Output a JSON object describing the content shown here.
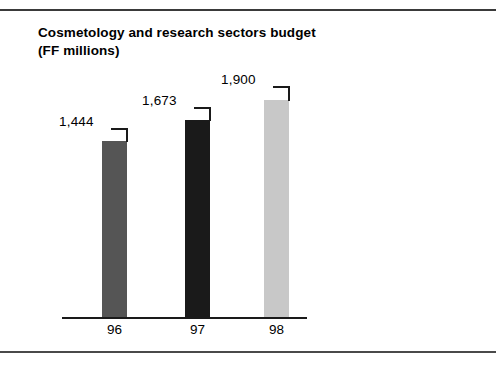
{
  "figure": {
    "width": 496,
    "height": 370,
    "background": "#ffffff",
    "rule_color": "#3a3a3a"
  },
  "title": {
    "line1": "Cosmetology and research sectors budget",
    "line2": "(FF millions)"
  },
  "chart_data": {
    "type": "bar",
    "title": "Cosmetology and research sectors budget (FF millions)",
    "xlabel": "",
    "ylabel": "FF millions",
    "categories": [
      "96",
      "97",
      "98"
    ],
    "values": [
      1444,
      1673,
      1900
    ],
    "value_labels": [
      "1,444",
      "1,673",
      "1,900"
    ],
    "series": [
      {
        "name": "Cosmetology and research sectors budget",
        "values": [
          1444,
          1673,
          1900
        ]
      }
    ],
    "bar_colors": [
      "#555555",
      "#1a1a1a",
      "#c8c8c8"
    ],
    "ylim": [
      0,
      2100
    ],
    "grid": false,
    "legend": false,
    "axis_color": "#1a1a1a",
    "units": "FF millions"
  },
  "bars": [
    {
      "category": "96",
      "value": 1444,
      "label": "1,444",
      "color": "#555555",
      "left": 102,
      "top": 141,
      "width": 25,
      "height": 176,
      "label_left": 59,
      "label_top": 114,
      "leader_h_left": 111,
      "leader_h_top": 128,
      "leader_h_width": 17,
      "leader_v_left": 126,
      "leader_v_top": 128,
      "leader_v_height": 14,
      "tick_left": 102,
      "tick_width": 25
    },
    {
      "category": "97",
      "value": 1673,
      "label": "1,673",
      "color": "#1a1a1a",
      "left": 185,
      "top": 120,
      "width": 25,
      "height": 197,
      "label_left": 142,
      "label_top": 93,
      "leader_h_left": 194,
      "leader_h_top": 107,
      "leader_h_width": 17,
      "leader_v_left": 209,
      "leader_v_top": 107,
      "leader_v_height": 14,
      "tick_left": 185,
      "tick_width": 25
    },
    {
      "category": "98",
      "value": 1900,
      "label": "1,900",
      "color": "#c8c8c8",
      "left": 264,
      "top": 100,
      "width": 25,
      "height": 217,
      "label_left": 221,
      "label_top": 72,
      "leader_h_left": 273,
      "leader_h_top": 86,
      "leader_h_width": 17,
      "leader_v_left": 288,
      "leader_v_top": 86,
      "leader_v_height": 15,
      "tick_left": 264,
      "tick_width": 25
    }
  ],
  "axis": {
    "left": 62,
    "top": 317,
    "width": 245,
    "color": "#1a1a1a"
  }
}
